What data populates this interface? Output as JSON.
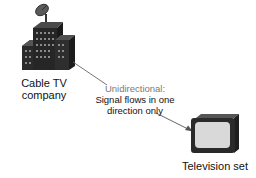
{
  "source": {
    "label_line1": "Cable TV",
    "label_line2": "company",
    "icon": "building-with-satellite-dish-icon"
  },
  "connection": {
    "heading": "Unidirectional:",
    "line1": "Signal flows in one",
    "line2": "direction only",
    "direction": "source-to-destination"
  },
  "destination": {
    "label": "Television set",
    "icon": "television-icon"
  },
  "colors": {
    "heading_gray": "#7a7a7a",
    "line_gray": "#555555",
    "building_dark": "#2a2a2a",
    "tv_screen": "#d9d9d9"
  }
}
